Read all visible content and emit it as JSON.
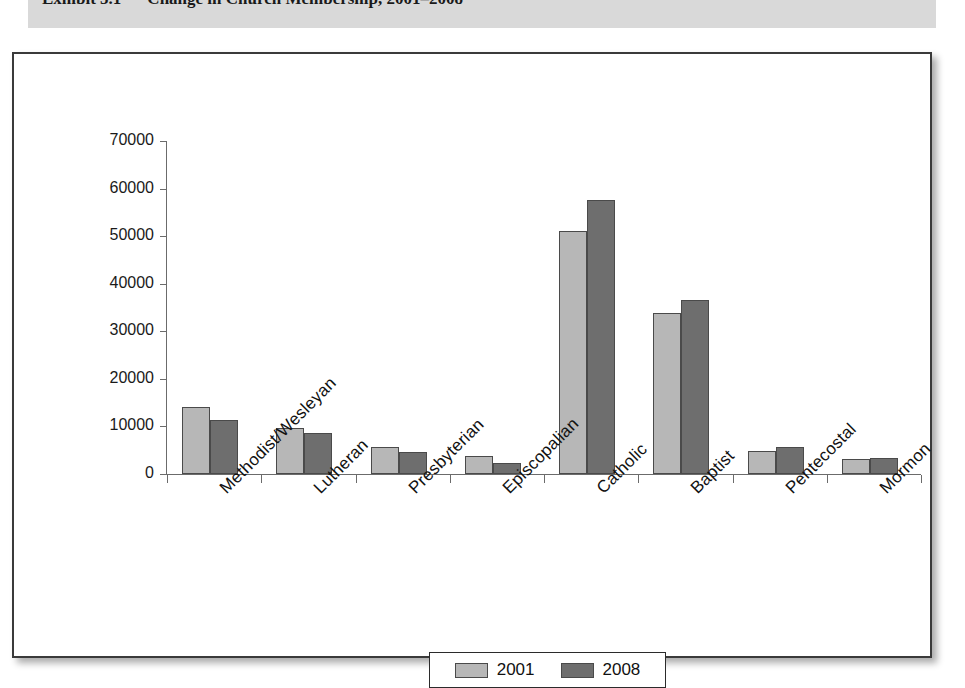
{
  "exhibit": {
    "label": "Exhibit 5.1",
    "title": "Change in Church Membership, 2001–2008"
  },
  "legend": {
    "items": [
      {
        "label": "2001",
        "color": "#b7b7b7"
      },
      {
        "label": "2008",
        "color": "#6e6e6e"
      }
    ]
  },
  "colors": {
    "series_2001": "#b7b7b7",
    "series_2008": "#6e6e6e",
    "axis": "#6b6b6b",
    "frame_border": "#3a3a3a",
    "header_band": "#d9d9d9"
  },
  "axis": {
    "y_ticks": [
      "0",
      "10000",
      "20000",
      "30000",
      "40000",
      "50000",
      "60000",
      "70000"
    ]
  },
  "chart_data": {
    "type": "bar",
    "title": "Change in Church Membership, 2001–2008",
    "xlabel": "",
    "ylabel": "",
    "ylim": [
      0,
      70000
    ],
    "ytick_step": 10000,
    "grid": false,
    "legend_position": "bottom",
    "categories": [
      "Methodist/Wesleyan",
      "Lutheran",
      "Presbyterian",
      "Episcopalian",
      "Catholic",
      "Baptist",
      "Pentecostal",
      "Mormon"
    ],
    "series": [
      {
        "name": "2001",
        "color": "#b7b7b7",
        "values": [
          14100,
          9700,
          5700,
          3800,
          51100,
          33900,
          4800,
          3100
        ]
      },
      {
        "name": "2008",
        "color": "#6e6e6e",
        "values": [
          11400,
          8700,
          4700,
          2400,
          57500,
          36600,
          5700,
          3400
        ]
      }
    ]
  }
}
